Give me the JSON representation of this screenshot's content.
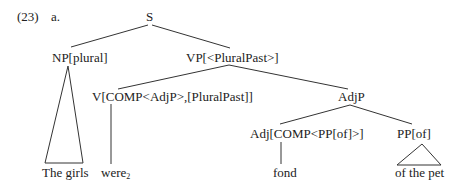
{
  "example": {
    "number": "(23)",
    "sub_label": "a."
  },
  "tree": {
    "root": "S",
    "np": "NP[plural]",
    "np_leaf": "The girls",
    "vp": "VP[<PluralPast>]",
    "v": "V[COMP<AdjP>,[PluralPast]]",
    "v_leaf": "were",
    "v_leaf_subscript": "2",
    "adjp": "AdjP",
    "adj": "Adj[COMP<PP[of]>]",
    "adj_leaf": "fond",
    "pp": "PP[of]",
    "pp_leaf": "of the pet"
  }
}
